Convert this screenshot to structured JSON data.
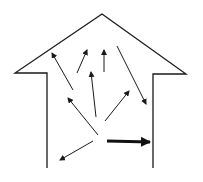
{
  "diagram": {
    "colors": {
      "line": "#1a1a1a",
      "background": "#ffffff"
    },
    "house": {
      "points": [
        [
          47,
          168
        ],
        [
          47,
          73
        ],
        [
          15,
          73
        ],
        [
          102,
          14
        ],
        [
          186,
          74
        ],
        [
          153,
          74
        ],
        [
          153,
          168
        ]
      ]
    },
    "arrows": [
      {
        "name": "arrow-up-left-far",
        "from": [
          73,
          90
        ],
        "to": [
          52,
          53
        ],
        "thick": false
      },
      {
        "name": "arrow-up-right-small",
        "from": [
          77,
          73
        ],
        "to": [
          87,
          50
        ],
        "thick": false
      },
      {
        "name": "arrow-up-center",
        "from": [
          104,
          72
        ],
        "to": [
          104,
          50
        ],
        "thick": false
      },
      {
        "name": "arrow-down-right",
        "from": [
          117,
          46
        ],
        "to": [
          146,
          104
        ],
        "thick": false
      },
      {
        "name": "arrow-up-mid",
        "from": [
          96,
          117
        ],
        "to": [
          91,
          72
        ],
        "thick": false
      },
      {
        "name": "arrow-up-left-mid",
        "from": [
          98,
          135
        ],
        "to": [
          68,
          98
        ],
        "thick": false
      },
      {
        "name": "arrow-up-right-mid",
        "from": [
          105,
          121
        ],
        "to": [
          129,
          91
        ],
        "thick": false
      },
      {
        "name": "arrow-down-left",
        "from": [
          93,
          141
        ],
        "to": [
          60,
          160
        ],
        "thick": false
      },
      {
        "name": "arrow-thick-right",
        "from": [
          107,
          141
        ],
        "to": [
          150,
          142
        ],
        "thick": true
      }
    ]
  }
}
